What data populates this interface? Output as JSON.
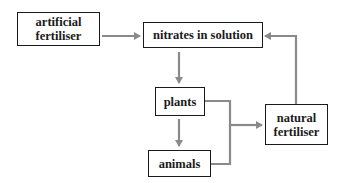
{
  "diagram": {
    "type": "flow",
    "nodes": [
      {
        "id": "artificial_fertiliser",
        "label": "artificial fertiliser",
        "line1": "artificial",
        "line2": "fertiliser"
      },
      {
        "id": "nitrates_in_solution",
        "label": "nitrates in solution"
      },
      {
        "id": "plants",
        "label": "plants"
      },
      {
        "id": "animals",
        "label": "animals"
      },
      {
        "id": "natural_fertiliser",
        "label": "natural fertiliser",
        "line1": "natural",
        "line2": "fertiliser"
      }
    ],
    "edges": [
      {
        "from": "artificial_fertiliser",
        "to": "nitrates_in_solution"
      },
      {
        "from": "nitrates_in_solution",
        "to": "plants"
      },
      {
        "from": "plants",
        "to": "animals"
      },
      {
        "from": "plants",
        "to": "natural_fertiliser"
      },
      {
        "from": "animals",
        "to": "natural_fertiliser"
      },
      {
        "from": "natural_fertiliser",
        "to": "nitrates_in_solution"
      }
    ],
    "colors": {
      "box_border": "#1a1a1a",
      "arrow": "#8a8a8a",
      "text": "#1a1a1a"
    }
  }
}
